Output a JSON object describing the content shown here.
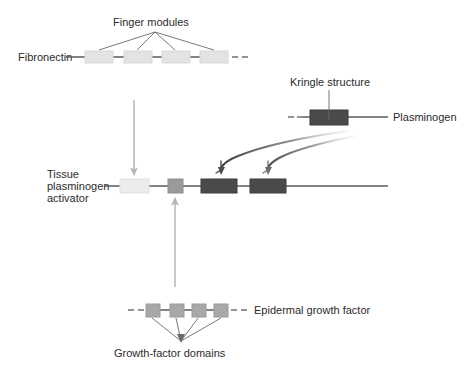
{
  "figure": {
    "background_color": "#ffffff"
  },
  "labels": {
    "finger_modules": "Finger modules",
    "fibronectin": "Fibronectin",
    "kringle_structure": "Kringle structure",
    "plasminogen": "Plasminogen",
    "tpa_line1": "Tissue",
    "tpa_line2": "plasminogen",
    "tpa_line3": "activator",
    "epidermal_growth_factor": "Epidermal growth factor",
    "growth_factor_domains": "Growth-factor domains"
  },
  "colors": {
    "backbone": "#5a5a5a",
    "finger_module": "#e3e3e3",
    "finger_module_stroke": "#d2d2d2",
    "egf_module": "#a8a8a8",
    "kringle_module": "#4a4a4a",
    "tpa_finger": "#ececec",
    "tpa_egf": "#9a9a9a",
    "tpa_kringle": "#4a4a4a",
    "leader_line": "#6a6a6a",
    "vertical_arrow": "#b5b5b5",
    "curved_arrow": "#555555",
    "text": "#2b2b2b"
  },
  "chains": {
    "fibronectin": {
      "name": "Fibronectin",
      "backbone": {
        "x1": 66,
        "x2": 228,
        "y": 57
      },
      "modules": [
        {
          "type": "finger",
          "x": 85,
          "y": 51,
          "w": 28,
          "h": 12
        },
        {
          "type": "finger",
          "x": 124,
          "y": 51,
          "w": 28,
          "h": 12
        },
        {
          "type": "finger",
          "x": 162,
          "y": 51,
          "w": 28,
          "h": 12
        },
        {
          "type": "finger",
          "x": 200,
          "y": 51,
          "w": 28,
          "h": 12
        }
      ],
      "trailing_dashes": [
        {
          "x1": 231,
          "x2": 237,
          "y": 57
        },
        {
          "x1": 241,
          "x2": 247,
          "y": 57
        }
      ]
    },
    "plasminogen": {
      "name": "Plasminogen",
      "backbone": {
        "x1": 302,
        "x2": 388,
        "y": 117
      },
      "leading_dashes": [
        {
          "x1": 288,
          "x2": 294,
          "y": 117
        },
        {
          "x1": 297,
          "x2": 302,
          "y": 117
        }
      ],
      "modules": [
        {
          "type": "kringle",
          "x": 310,
          "y": 110,
          "w": 38,
          "h": 15
        }
      ]
    },
    "tissue_plasminogen_activator": {
      "name": "Tissue plasminogen activator",
      "backbone": {
        "x1": 104,
        "x2": 388,
        "y": 186
      },
      "modules": [
        {
          "type": "finger",
          "x": 120,
          "y": 179,
          "w": 29,
          "h": 14
        },
        {
          "type": "egf",
          "x": 168,
          "y": 179,
          "w": 15,
          "h": 14
        },
        {
          "type": "kringle",
          "x": 201,
          "y": 179,
          "w": 36,
          "h": 14
        },
        {
          "type": "kringle",
          "x": 250,
          "y": 179,
          "w": 36,
          "h": 14
        }
      ]
    },
    "epidermal_growth_factor": {
      "name": "Epidermal growth factor",
      "backbone": {
        "x1": 146,
        "x2": 228,
        "y": 310
      },
      "leading_dashes": [
        {
          "x1": 128,
          "x2": 134,
          "y": 310
        },
        {
          "x1": 138,
          "x2": 144,
          "y": 310
        }
      ],
      "trailing_dashes": [
        {
          "x1": 231,
          "x2": 237,
          "y": 310
        },
        {
          "x1": 241,
          "x2": 247,
          "y": 310
        }
      ],
      "modules": [
        {
          "type": "egf",
          "x": 146,
          "y": 304,
          "w": 14,
          "h": 13
        },
        {
          "type": "egf",
          "x": 170,
          "y": 304,
          "w": 14,
          "h": 13
        },
        {
          "type": "egf",
          "x": 192,
          "y": 304,
          "w": 14,
          "h": 13
        },
        {
          "type": "egf",
          "x": 214,
          "y": 304,
          "w": 14,
          "h": 13
        }
      ]
    }
  },
  "annotations": {
    "finger_leader": {
      "apex": {
        "x": 155,
        "y": 32
      },
      "targets": [
        {
          "x": 99,
          "y": 50
        },
        {
          "x": 137,
          "y": 50
        },
        {
          "x": 175,
          "y": 50
        },
        {
          "x": 214,
          "y": 50
        }
      ]
    },
    "kringle_leader": {
      "from": {
        "x": 329,
        "y": 89
      },
      "to": {
        "x": 329,
        "y": 118
      }
    },
    "growth_factor_leader": {
      "apex": {
        "x": 181,
        "y": 341
      },
      "targets": [
        {
          "x": 152,
          "y": 318
        },
        {
          "x": 175,
          "y": 318
        },
        {
          "x": 198,
          "y": 318
        },
        {
          "x": 221,
          "y": 318
        }
      ]
    },
    "arrow_fibronectin_to_tpa": {
      "from": {
        "x": 134,
        "y": 100
      },
      "to": {
        "x": 134,
        "y": 176
      }
    },
    "arrow_egf_to_tpa": {
      "from": {
        "x": 175,
        "y": 287
      },
      "to": {
        "x": 175,
        "y": 197
      }
    },
    "arrow_kringle_to_tpa_1": {
      "path": "M 343,132 C 300,139 258,148 229,165",
      "tip": {
        "x": 226,
        "y": 172
      }
    },
    "arrow_kringle_to_tpa_2": {
      "path": "M 350,137 C 320,146 292,152 275,165",
      "tip": {
        "x": 272,
        "y": 172
      }
    }
  }
}
